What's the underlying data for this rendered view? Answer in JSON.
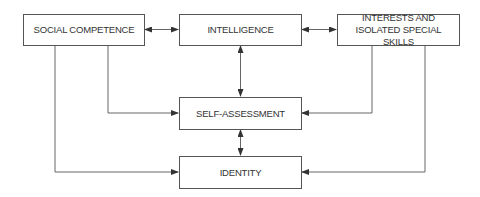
{
  "diagram": {
    "nodes": {
      "social": {
        "label": "SOCIAL COMPETENCE"
      },
      "intelligence": {
        "label": "INTELLIGENCE"
      },
      "interests": {
        "label": "INTERESTS AND ISOLATED SPECIAL SKILLS"
      },
      "self_assessment": {
        "label": "SELF-ASSESSMENT"
      },
      "identity": {
        "label": "IDENTITY"
      }
    },
    "edges": [
      {
        "from": "social",
        "to": "intelligence",
        "type": "bidirectional"
      },
      {
        "from": "intelligence",
        "to": "interests",
        "type": "bidirectional"
      },
      {
        "from": "intelligence",
        "to": "self_assessment",
        "type": "bidirectional"
      },
      {
        "from": "self_assessment",
        "to": "identity",
        "type": "bidirectional"
      },
      {
        "from": "social",
        "to": "self_assessment",
        "type": "directed"
      },
      {
        "from": "social",
        "to": "identity",
        "type": "directed"
      },
      {
        "from": "interests",
        "to": "self_assessment",
        "type": "directed"
      },
      {
        "from": "interests",
        "to": "identity",
        "type": "directed"
      }
    ],
    "colors": {
      "line": "#555555",
      "text": "#333333"
    }
  }
}
